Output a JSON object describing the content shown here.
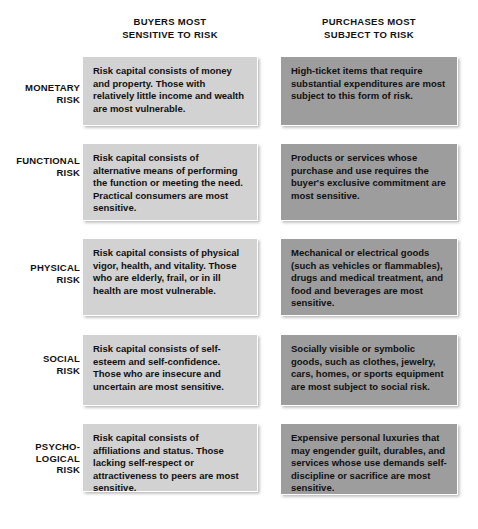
{
  "figure": {
    "colors": {
      "page_background": "#ffffff",
      "left_cell_background": "#d2d2d2",
      "right_cell_background": "#9d9d9d",
      "cell_border": "#ffffff",
      "text": "#101010"
    }
  },
  "columns": [
    {
      "id": "buyers",
      "line1": "BUYERS MOST",
      "line2": "SENSITIVE TO RISK"
    },
    {
      "id": "purchases",
      "line1": "PURCHASES MOST",
      "line2": "SUBJECT TO RISK"
    }
  ],
  "rows": [
    {
      "id": "monetary",
      "label_line1": "MONETARY",
      "label_line2": "RISK",
      "label_line3": "",
      "buyers": "Risk capital consists of money and property. Those with relatively little income and wealth are most vulnerable.",
      "purchases": "High-ticket items that require substantial expenditures are most subject to this form of risk."
    },
    {
      "id": "functional",
      "label_line1": "FUNCTIONAL",
      "label_line2": "RISK",
      "label_line3": "",
      "buyers": "Risk capital consists of alternative means of performing the function or meeting the need. Practical consumers are most sensitive.",
      "purchases": "Products or services whose purchase and use requires the buyer's exclusive commitment are most sensitive."
    },
    {
      "id": "physical",
      "label_line1": "PHYSICAL",
      "label_line2": "RISK",
      "label_line3": "",
      "buyers": "Risk capital consists of physical vigor, health, and vitality. Those who are elderly, frail, or in ill health are most vulnerable.",
      "purchases": "Mechanical or electrical goods (such as vehicles or flammables), drugs and medical treatment, and food and beverages are most sensitive."
    },
    {
      "id": "social",
      "label_line1": "SOCIAL",
      "label_line2": "RISK",
      "label_line3": "",
      "buyers": "Risk capital consists of self-esteem and self-confidence. Those who are insecure and uncertain are most sensitive.",
      "purchases": "Socially visible or symbolic goods, such as clothes, jewelry, cars, homes, or sports equipment are most subject to social risk."
    },
    {
      "id": "psychological",
      "label_line1": "PSYCHO-",
      "label_line2": "LOGICAL",
      "label_line3": "RISK",
      "buyers": "Risk capital consists of affiliations and status. Those lacking self-respect or attractiveness to peers are most sensitive.",
      "purchases": "Expensive personal luxuries that may engender guilt, durables, and services whose use demands self-discipline or sacrifice are most sensitive."
    }
  ]
}
